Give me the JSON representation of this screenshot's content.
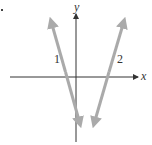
{
  "diagram": {
    "type": "coordinate-plane",
    "axes": {
      "x_label": "x",
      "y_label": "y",
      "axis_color": "#333333"
    },
    "lines": [
      {
        "label": "1",
        "color": "#aaaaaa",
        "slope_sign": "negative"
      },
      {
        "label": "2",
        "color": "#aaaaaa",
        "slope_sign": "positive"
      }
    ]
  }
}
